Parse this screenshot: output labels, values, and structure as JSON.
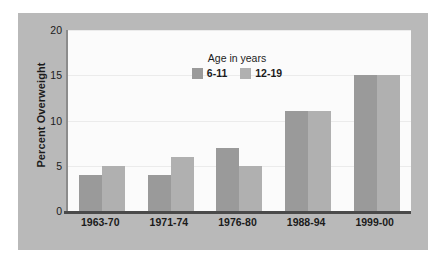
{
  "chart_data": {
    "type": "bar",
    "title": "",
    "xlabel": "",
    "ylabel": "Percent Overweight",
    "categories": [
      "1963-70",
      "1971-74",
      "1976-80",
      "1988-94",
      "1999-00"
    ],
    "series": [
      {
        "name": "6-11",
        "values": [
          4,
          4,
          7,
          11,
          15
        ],
        "color": "#9a9a9a"
      },
      {
        "name": "12-19",
        "values": [
          5,
          6,
          5,
          11,
          15
        ],
        "color": "#b0b0b0"
      }
    ],
    "ylim": [
      0,
      20
    ],
    "yticks": [
      0,
      5,
      10,
      15,
      20
    ],
    "ytick_labels": [
      "0",
      "5",
      "10",
      "15",
      "20"
    ],
    "grid": true,
    "legend": {
      "title": "Age in years",
      "position": "top-center",
      "entries": [
        "6-11",
        "12-19"
      ]
    },
    "colors": {
      "panel_background": "#b9b9b9",
      "plot_background": "#fbfbfb",
      "gridline": "#ebebeb",
      "axis": "#4a4a4a",
      "text": "#1b1b1b"
    }
  }
}
